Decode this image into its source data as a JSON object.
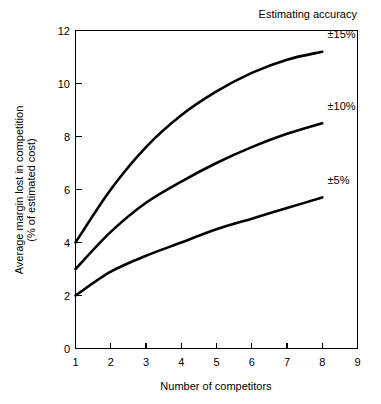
{
  "chart_data": {
    "type": "line",
    "title": "Estimating accuracy",
    "xlabel": "Number of competitors",
    "ylabel_line1": "Average margin lost in competition",
    "ylabel_line2": "(% of estimated cost)",
    "ylabel": "Average margin lost in competition (% of estimated cost)",
    "xlim": [
      1,
      9
    ],
    "ylim": [
      0,
      12
    ],
    "xticks": [
      1,
      2,
      3,
      4,
      5,
      6,
      7,
      8,
      9
    ],
    "xtick_labels": [
      "1",
      "2",
      "3",
      "4",
      "5",
      "6",
      "7",
      "8",
      "9"
    ],
    "yticks": [
      0,
      2,
      4,
      6,
      8,
      10,
      12
    ],
    "ytick_labels": [
      "0",
      "2",
      "4",
      "6",
      "8",
      "10",
      "12"
    ],
    "grid": false,
    "legend_position": "inline-right-of-curve-ends",
    "x": [
      1,
      2,
      3,
      4,
      5,
      6,
      7,
      8
    ],
    "series": [
      {
        "name": "±15%",
        "label": "±15%",
        "label_x": 8.15,
        "label_y": 11.7,
        "values": [
          4.0,
          6.0,
          7.6,
          8.8,
          9.7,
          10.4,
          10.9,
          11.2
        ]
      },
      {
        "name": "±10%",
        "label": "±10%",
        "label_x": 8.15,
        "label_y": 9.0,
        "values": [
          3.0,
          4.4,
          5.5,
          6.3,
          7.0,
          7.6,
          8.1,
          8.5
        ]
      },
      {
        "name": "±5%",
        "label": "±5%",
        "label_x": 8.15,
        "label_y": 6.2,
        "values": [
          2.0,
          2.9,
          3.5,
          4.0,
          4.5,
          4.9,
          5.3,
          5.7
        ]
      }
    ]
  },
  "figure": {
    "background_color": "#ffffff",
    "line_color": "#000000",
    "axis_color": "#000000"
  }
}
